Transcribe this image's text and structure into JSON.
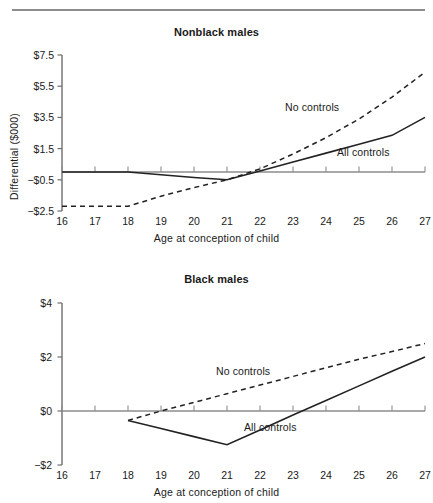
{
  "figure": {
    "x_axis_title": "Age at conception of child",
    "y_axis_title": "Differential ($000)"
  },
  "chart_data": [
    {
      "type": "line",
      "title": "Nonblack males",
      "xlabel": "Age at conception of child",
      "ylabel": "Differential ($000)",
      "xlim": [
        16,
        27
      ],
      "ylim": [
        -2.5,
        7.5
      ],
      "xticks": [
        16,
        17,
        18,
        19,
        20,
        21,
        22,
        23,
        24,
        25,
        26,
        27
      ],
      "xtick_labels": [
        "16",
        "17",
        "18",
        "19",
        "20",
        "21",
        "22",
        "23",
        "24",
        "25",
        "26",
        "27"
      ],
      "yticks": [
        -2.5,
        -0.5,
        1.5,
        3.5,
        5.5,
        7.5
      ],
      "ytick_labels": [
        "−$2.5",
        "−$0.5",
        "$1.5",
        "$3.5",
        "$5.5",
        "$7.5"
      ],
      "grid": false,
      "legend_position": "inline-annotation",
      "zero_reference_line": 0,
      "series": [
        {
          "name": "No controls",
          "style": "dashed",
          "color": "#222222",
          "x": [
            16,
            17,
            18,
            19,
            20,
            21,
            22,
            23,
            24,
            25,
            26,
            27
          ],
          "values": [
            -2.2,
            -2.2,
            -2.2,
            -1.55,
            -1.0,
            -0.5,
            0.2,
            1.15,
            2.2,
            3.4,
            4.8,
            6.4
          ],
          "annotation": "No controls"
        },
        {
          "name": "All controls",
          "style": "solid",
          "color": "#222222",
          "x": [
            16,
            17,
            18,
            19,
            20,
            21,
            22,
            23,
            24,
            25,
            26,
            27
          ],
          "values": [
            0.0,
            0.0,
            0.0,
            -0.18,
            -0.35,
            -0.5,
            0.07,
            0.64,
            1.21,
            1.78,
            2.35,
            3.5
          ],
          "annotation": "All controls"
        }
      ]
    },
    {
      "type": "line",
      "title": "Black males",
      "xlabel": "Age at conception of child",
      "ylabel": "Differential ($000)",
      "xlim": [
        16,
        27
      ],
      "ylim": [
        -2,
        4
      ],
      "xticks": [
        16,
        17,
        18,
        19,
        20,
        21,
        22,
        23,
        24,
        25,
        26,
        27
      ],
      "xtick_labels": [
        "16",
        "17",
        "18",
        "19",
        "20",
        "21",
        "22",
        "23",
        "24",
        "25",
        "26",
        "27"
      ],
      "yticks": [
        -2,
        0,
        2,
        4
      ],
      "ytick_labels": [
        "−$2",
        "$0",
        "$2",
        "$4"
      ],
      "grid": false,
      "legend_position": "inline-annotation",
      "zero_reference_line": 0,
      "series": [
        {
          "name": "No controls",
          "style": "dashed",
          "color": "#222222",
          "x": [
            18,
            19,
            20,
            21,
            22,
            23,
            24,
            25,
            26,
            27
          ],
          "values": [
            -0.35,
            0.0,
            0.32,
            0.64,
            0.96,
            1.28,
            1.6,
            1.92,
            2.2,
            2.5
          ],
          "annotation": "No controls"
        },
        {
          "name": "All controls",
          "style": "solid",
          "color": "#222222",
          "x": [
            18,
            19,
            20,
            21,
            22,
            23,
            24,
            25,
            26,
            27
          ],
          "values": [
            -0.35,
            -0.65,
            -0.95,
            -1.25,
            -0.7,
            -0.15,
            0.39,
            0.93,
            1.47,
            2.0
          ],
          "annotation": "All controls"
        }
      ]
    }
  ],
  "panels": [
    {
      "id": "nonblack-males",
      "title": "Nonblack males",
      "series_annotations": [
        {
          "text": "No controls",
          "left": 285,
          "top": 101
        },
        {
          "text": "All controls",
          "left": 337,
          "top": 146
        }
      ]
    },
    {
      "id": "black-males",
      "title": "Black males",
      "series_annotations": [
        {
          "text": "No controls",
          "left": 216,
          "top": 365
        },
        {
          "text": "All controls",
          "left": 244,
          "top": 421
        }
      ]
    }
  ]
}
